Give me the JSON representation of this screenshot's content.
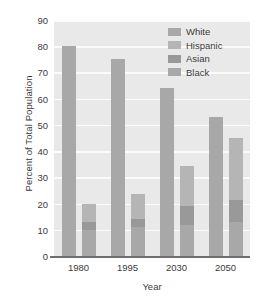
{
  "chart_data": {
    "type": "bar",
    "subtype": "grouped-stacked",
    "title": "",
    "xlabel": "Year",
    "ylabel": "Percent of Total Population",
    "categories": [
      "1980",
      "1995",
      "2030",
      "2050"
    ],
    "ylim": [
      0,
      90
    ],
    "yticks": [
      0,
      10,
      20,
      30,
      40,
      50,
      60,
      70,
      80,
      90
    ],
    "ytick_labels": [
      "0",
      "10",
      "20",
      "30",
      "40",
      "50",
      "60",
      "70",
      "80",
      "90"
    ],
    "grid": true,
    "grid_axis": "y",
    "legend_position": "top-right",
    "legend": [
      "White",
      "Hispanic",
      "Asian",
      "Black"
    ],
    "series": [
      {
        "name": "White",
        "values": [
          80,
          75,
          64,
          53
        ],
        "color": "#a8a8a8",
        "stack": "white-bar"
      },
      {
        "name": "Black",
        "values": [
          10,
          11,
          12,
          13
        ],
        "color": "#a8a8a8",
        "stack": "minority-bar"
      },
      {
        "name": "Asian",
        "values": [
          3,
          3,
          7,
          8.5
        ],
        "color": "#999999",
        "stack": "minority-bar"
      },
      {
        "name": "Hispanic",
        "values": [
          7,
          9.5,
          15.5,
          23.5
        ],
        "color": "#b5b5b5",
        "stack": "minority-bar"
      }
    ],
    "minority_bar_totals": [
      20,
      23.5,
      34.5,
      45
    ],
    "colors": {
      "plot_background": "#e9e9e9",
      "gridline": "#fbfbfb",
      "axis_line": "#6f6f6f",
      "text": "#3b3b3b",
      "page_background": "#ffffff"
    }
  }
}
